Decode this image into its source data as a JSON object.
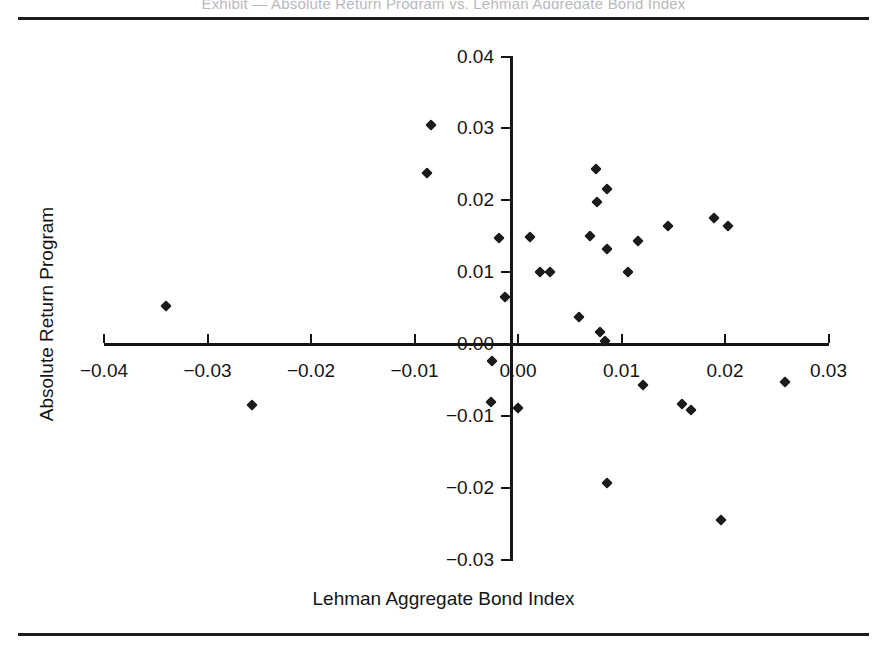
{
  "figure": {
    "cut_caption": "Exhibit — Absolute Return Program vs. Lehman Aggregate Bond Index",
    "top_rule": "horizontal-rule",
    "bottom_rule": "horizontal-rule"
  },
  "chart_data": {
    "type": "scatter",
    "title": "",
    "xlabel": "Lehman Aggregate Bond Index",
    "ylabel": "Absolute Return Program",
    "xlim": [
      -0.04,
      0.03
    ],
    "ylim": [
      -0.03,
      0.04
    ],
    "xticks": [
      -0.04,
      -0.03,
      -0.02,
      -0.01,
      0.0,
      0.01,
      0.02,
      0.03
    ],
    "xtick_labels": [
      "-0.04",
      "-0.03",
      "-0.02",
      "-0.01",
      "0.00",
      "0.01",
      "0.02",
      "0.03"
    ],
    "yticks": [
      -0.03,
      -0.02,
      -0.01,
      0.0,
      0.01,
      0.02,
      0.03,
      0.04
    ],
    "ytick_labels": [
      "-0.03",
      "-0.02",
      "-0.01",
      "0.00",
      "0.01",
      "0.02",
      "0.03",
      "0.04"
    ],
    "grid": false,
    "legend": null,
    "marker": "diamond",
    "marker_color": "#1b1b1b",
    "points": [
      {
        "x": -0.034,
        "y": 0.0053
      },
      {
        "x": -0.0257,
        "y": -0.0085
      },
      {
        "x": -0.0084,
        "y": 0.0305
      },
      {
        "x": -0.0088,
        "y": 0.0238
      },
      {
        "x": -0.0018,
        "y": 0.0147
      },
      {
        "x": -0.0013,
        "y": 0.0065
      },
      {
        "x": -0.0025,
        "y": -0.0024
      },
      {
        "x": -0.0026,
        "y": -0.008
      },
      {
        "x": 0.0012,
        "y": 0.0149
      },
      {
        "x": 0.0021,
        "y": 0.0101
      },
      {
        "x": 0.0031,
        "y": 0.01
      },
      {
        "x": 0.0,
        "y": -0.0088
      },
      {
        "x": 0.0059,
        "y": 0.0038
      },
      {
        "x": 0.007,
        "y": 0.015
      },
      {
        "x": 0.0075,
        "y": 0.0243
      },
      {
        "x": 0.0076,
        "y": 0.0198
      },
      {
        "x": 0.0079,
        "y": 0.0017
      },
      {
        "x": 0.0086,
        "y": 0.0133
      },
      {
        "x": 0.0086,
        "y": 0.0216
      },
      {
        "x": 0.0084,
        "y": 0.0005
      },
      {
        "x": 0.0086,
        "y": -0.0193
      },
      {
        "x": 0.0106,
        "y": 0.01
      },
      {
        "x": 0.0116,
        "y": 0.0143
      },
      {
        "x": 0.0121,
        "y": -0.0057
      },
      {
        "x": 0.0145,
        "y": 0.0164
      },
      {
        "x": 0.0158,
        "y": -0.0083
      },
      {
        "x": 0.0167,
        "y": -0.0092
      },
      {
        "x": 0.0189,
        "y": 0.0175
      },
      {
        "x": 0.0196,
        "y": -0.0245
      },
      {
        "x": 0.0203,
        "y": 0.0164
      },
      {
        "x": 0.0258,
        "y": -0.0052
      }
    ]
  }
}
